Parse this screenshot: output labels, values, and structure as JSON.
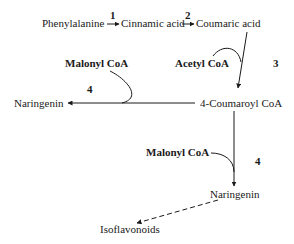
{
  "diagram": {
    "type": "biosynthetic-pathway",
    "nodes": {
      "phenylalanine": "Phenylalanine",
      "cinnamic_acid": "Cinnamic acid",
      "coumaric_acid": "Coumaric acid",
      "acetyl_coa": "Acetyl CoA",
      "malonyl_coa_top": "Malonyl CoA",
      "naringenin_left": "Naringenin",
      "coumaroyl_coa": "4-Coumaroyl CoA",
      "malonyl_coa_bottom": "Malonyl CoA",
      "naringenin_bottom": "Naringenin",
      "isoflavonoids": "Isoflavonoids"
    },
    "step_labels": {
      "step1": "1",
      "step2": "2",
      "step3": "3",
      "step4_left": "4",
      "step4_right": "4"
    },
    "edges": [
      {
        "from": "Phenylalanine",
        "to": "Cinnamic acid",
        "label": "1",
        "style": "solid"
      },
      {
        "from": "Cinnamic acid",
        "to": "Coumaric acid",
        "label": "2",
        "style": "solid"
      },
      {
        "from": "Coumaric acid",
        "to": "4-Coumaroyl CoA",
        "label": "3",
        "cofactor": "Acetyl CoA",
        "style": "solid"
      },
      {
        "from": "4-Coumaroyl CoA",
        "to": "Naringenin",
        "label": "4",
        "cofactor": "Malonyl CoA",
        "style": "solid"
      },
      {
        "from": "4-Coumaroyl CoA",
        "to": "Naringenin",
        "label": "4",
        "cofactor": "Malonyl CoA",
        "style": "solid"
      },
      {
        "from": "Naringenin",
        "to": "Isoflavonoids",
        "style": "dashed"
      }
    ],
    "colors": {
      "line": "#1a1a1a",
      "background": "#ffffff"
    }
  }
}
